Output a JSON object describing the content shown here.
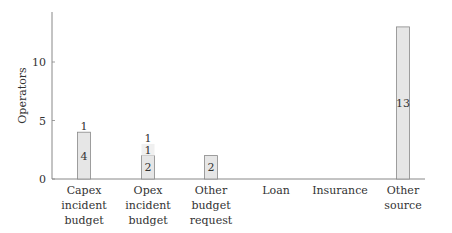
{
  "chart_data": {
    "type": "bar",
    "stacked": true,
    "title": "",
    "xlabel": "",
    "ylabel": "Operators",
    "ylim": [
      0,
      14
    ],
    "yticks": [
      0,
      5,
      10
    ],
    "grid": false,
    "legend": null,
    "categories": [
      "Capex incident budget",
      "Opex incident budget",
      "Other budget request",
      "Loan",
      "Insurance",
      "Other source"
    ],
    "category_lines": [
      [
        "Capex",
        "incident",
        "budget"
      ],
      [
        "Opex",
        "incident",
        "budget"
      ],
      [
        "Other",
        "budget",
        "request"
      ],
      [
        "Loan"
      ],
      [
        "Insurance"
      ],
      [
        "Other",
        "source"
      ]
    ],
    "series": [
      {
        "name": "segment-1",
        "values": [
          4,
          2,
          2,
          0,
          0,
          13
        ],
        "labels": [
          "4",
          "2",
          "2",
          "",
          "",
          "13"
        ]
      },
      {
        "name": "segment-2",
        "values": [
          0,
          1,
          0,
          0,
          0,
          0
        ],
        "labels": [
          "",
          "1",
          "",
          "",
          "",
          ""
        ]
      },
      {
        "name": "segment-3",
        "values": [
          0,
          0,
          0,
          0,
          0,
          0
        ],
        "labels": [
          "1",
          "1",
          "",
          "",
          "",
          ""
        ]
      }
    ],
    "colors": {
      "bar_fill": "#e6e6e6",
      "bar_fill_light": "#f0f0f0",
      "bar_stroke": "#888888",
      "axis": "#888888"
    }
  }
}
